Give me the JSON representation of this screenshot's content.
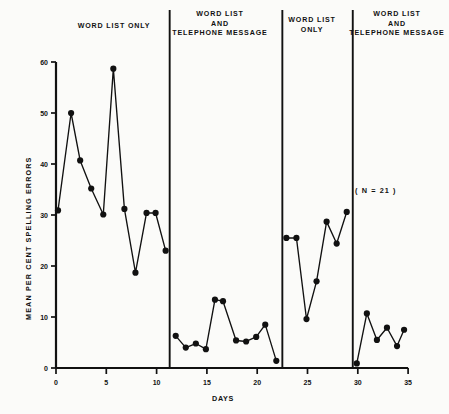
{
  "figure": {
    "background_color": "#fbfbf9",
    "ink_color": "#111111"
  },
  "axes": {
    "x_label": "DAYS",
    "y_label": "MEAN PER CENT SPELLING ERRORS",
    "x_ticks": [
      "0",
      "5",
      "10",
      "15",
      "20",
      "25",
      "30",
      "35"
    ],
    "y_ticks": [
      "0",
      "10",
      "20",
      "30",
      "40",
      "50",
      "60"
    ]
  },
  "annotation": {
    "sample_size": "( N = 21 )"
  },
  "panels": [
    {
      "id": "panel-1",
      "title": "WORD LIST ONLY"
    },
    {
      "id": "panel-2",
      "title": "WORD LIST\nAND\nTELEPHONE MESSAGE"
    },
    {
      "id": "panel-3",
      "title": "WORD LIST\nONLY"
    },
    {
      "id": "panel-4",
      "title": "WORD LIST\nAND\nTELEPHONE MESSAGE"
    }
  ],
  "chart_data": {
    "type": "line",
    "title": "",
    "xlabel": "DAYS",
    "ylabel": "MEAN PER CENT SPELLING ERRORS",
    "xlim": [
      0,
      35
    ],
    "ylim": [
      0,
      60
    ],
    "xticks": [
      0,
      5,
      10,
      15,
      20,
      25,
      30,
      35
    ],
    "yticks": [
      0,
      10,
      20,
      30,
      40,
      50,
      60
    ],
    "grid": false,
    "legend": "none",
    "marker": "filled-circle",
    "annotations": [
      {
        "text": "( N = 21 )",
        "x": 31.0,
        "y": 34.0
      }
    ],
    "phase_dividers": [
      11.3,
      22.5,
      29.5
    ],
    "phase_labels": [
      "WORD LIST ONLY",
      "WORD LIST AND TELEPHONE MESSAGE",
      "WORD LIST ONLY",
      "WORD LIST AND TELEPHONE MESSAGE"
    ],
    "series": [
      {
        "name": "WORD LIST ONLY (phase 1)",
        "x": [
          0.2,
          1.5,
          2.4,
          3.5,
          4.7,
          5.7,
          6.8,
          7.9,
          9.0,
          9.9,
          10.9
        ],
        "values": [
          30.9,
          50.0,
          40.7,
          35.2,
          30.1,
          58.7,
          31.2,
          18.7,
          30.4,
          30.4,
          23.0
        ]
      },
      {
        "name": "WORD LIST AND TELEPHONE MESSAGE (phase 2)",
        "x": [
          11.9,
          12.9,
          13.9,
          14.9,
          15.8,
          16.6,
          17.9,
          18.9,
          19.9,
          20.8,
          21.9
        ],
        "values": [
          6.3,
          4.0,
          4.8,
          3.7,
          13.4,
          13.1,
          5.4,
          5.2,
          6.1,
          8.5,
          1.4
        ]
      },
      {
        "name": "WORD LIST ONLY (phase 3)",
        "x": [
          22.9,
          23.9,
          24.9,
          25.9,
          26.9,
          27.9,
          28.9
        ],
        "values": [
          25.5,
          25.5,
          9.6,
          17.0,
          28.7,
          24.4,
          30.6
        ]
      },
      {
        "name": "WORD LIST AND TELEPHONE MESSAGE (phase 4)",
        "x": [
          29.9,
          30.9,
          31.9,
          32.9,
          33.9,
          34.6
        ],
        "values": [
          0.9,
          10.7,
          5.5,
          7.9,
          4.3,
          7.5
        ]
      }
    ]
  }
}
